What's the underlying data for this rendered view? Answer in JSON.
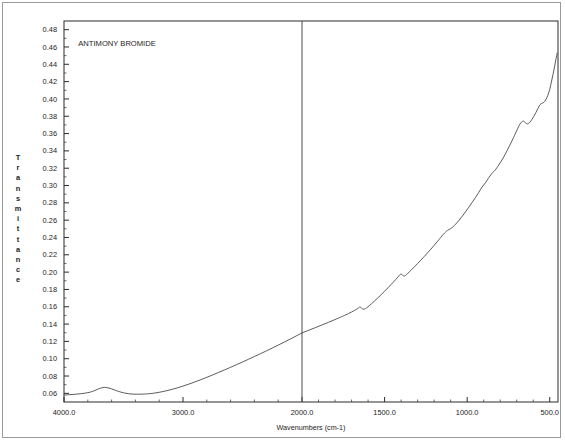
{
  "document": {
    "kind": "ir-spectrum-scan",
    "background_color": "#ffffff",
    "frame_color": "#9a9a9a"
  },
  "chart_data": {
    "type": "line",
    "title": "ANTIMONY BROMIDE",
    "xlabel": "Wavenumbers (cm-1)",
    "ylabel": "Transmittance",
    "ylabel_letters": [
      "T",
      "r",
      "a",
      "n",
      "s",
      "m",
      "i",
      "t",
      "t",
      "a",
      "n",
      "c",
      "e"
    ],
    "grid": false,
    "legend_position": "none",
    "line_color": "#4a4a4a",
    "axis_color": "#2b2b2b",
    "xlim": [
      4000.0,
      450.0
    ],
    "ylim": [
      0.05,
      0.49
    ],
    "x_axis_note": "piecewise scale: 4000-2000 compressed, 2000-450 expanded",
    "x_breakpoint": 2000.0,
    "xticks": [
      4000.0,
      3000.0,
      2000.0,
      1500.0,
      1000.0,
      500.0
    ],
    "xtick_labels": [
      "4000.0",
      "3000.0",
      "2000.0",
      "1500.0",
      "1000.0",
      "500.0"
    ],
    "x_minor_step_high": 200,
    "x_minor_step_low": 100,
    "yticks": [
      0.06,
      0.08,
      0.1,
      0.12,
      0.14,
      0.16,
      0.18,
      0.2,
      0.22,
      0.24,
      0.26,
      0.28,
      0.3,
      0.32,
      0.34,
      0.36,
      0.38,
      0.4,
      0.42,
      0.44,
      0.46,
      0.48
    ],
    "ytick_labels": [
      "0.06",
      "0.08",
      "0.10",
      "0.12",
      "0.14",
      "0.16",
      "0.18",
      "0.20",
      "0.22",
      "0.24",
      "0.26",
      "0.28",
      "0.30",
      "0.32",
      "0.34",
      "0.36",
      "0.38",
      "0.40",
      "0.42",
      "0.44",
      "0.46",
      "0.48"
    ],
    "divider_x": 2000.0,
    "series": [
      {
        "name": "ANTIMONY BROMIDE",
        "x": [
          4000,
          3950,
          3900,
          3850,
          3800,
          3760,
          3720,
          3690,
          3660,
          3630,
          3600,
          3570,
          3540,
          3500,
          3460,
          3420,
          3380,
          3340,
          3300,
          3250,
          3200,
          3150,
          3100,
          3050,
          3000,
          2950,
          2900,
          2850,
          2800,
          2750,
          2700,
          2650,
          2600,
          2550,
          2500,
          2450,
          2400,
          2350,
          2300,
          2250,
          2200,
          2150,
          2100,
          2050,
          2000,
          1960,
          1920,
          1880,
          1840,
          1800,
          1760,
          1740,
          1720,
          1700,
          1680,
          1665,
          1655,
          1648,
          1640,
          1630,
          1615,
          1600,
          1580,
          1560,
          1540,
          1520,
          1500,
          1480,
          1460,
          1440,
          1425,
          1415,
          1408,
          1400,
          1392,
          1384,
          1375,
          1360,
          1340,
          1320,
          1300,
          1280,
          1260,
          1240,
          1220,
          1200,
          1180,
          1160,
          1145,
          1130,
          1120,
          1110,
          1100,
          1085,
          1070,
          1050,
          1030,
          1010,
          990,
          970,
          950,
          930,
          910,
          890,
          875,
          862,
          852,
          845,
          838,
          830,
          820,
          808,
          795,
          782,
          770,
          758,
          745,
          732,
          720,
          706,
          695,
          685,
          676,
          668,
          660,
          650,
          640,
          630,
          620,
          608,
          596,
          584,
          572,
          560,
          548,
          536,
          524,
          512,
          500,
          490,
          480,
          470,
          462,
          455
        ],
        "y": [
          0.058,
          0.0585,
          0.059,
          0.0597,
          0.0608,
          0.0622,
          0.0645,
          0.0661,
          0.0668,
          0.0664,
          0.0652,
          0.0636,
          0.0622,
          0.0606,
          0.0596,
          0.0591,
          0.059,
          0.0591,
          0.0594,
          0.0601,
          0.0612,
          0.0626,
          0.0643,
          0.0662,
          0.0684,
          0.0707,
          0.0732,
          0.0758,
          0.0785,
          0.0813,
          0.0842,
          0.0871,
          0.0901,
          0.0931,
          0.0962,
          0.0993,
          0.1025,
          0.1057,
          0.109,
          0.1123,
          0.1157,
          0.1191,
          0.1226,
          0.1262,
          0.1298,
          0.1328,
          0.1358,
          0.1389,
          0.142,
          0.1452,
          0.1485,
          0.1502,
          0.152,
          0.1539,
          0.156,
          0.1577,
          0.159,
          0.1598,
          0.1584,
          0.1572,
          0.158,
          0.16,
          0.1633,
          0.1668,
          0.1704,
          0.1741,
          0.1779,
          0.1818,
          0.1858,
          0.1899,
          0.1931,
          0.1953,
          0.1968,
          0.1978,
          0.1965,
          0.1956,
          0.196,
          0.1985,
          0.2022,
          0.206,
          0.2099,
          0.2139,
          0.218,
          0.2222,
          0.2265,
          0.2309,
          0.2354,
          0.24,
          0.2435,
          0.2464,
          0.248,
          0.2492,
          0.2501,
          0.2524,
          0.2553,
          0.2597,
          0.2645,
          0.2696,
          0.2749,
          0.2804,
          0.2861,
          0.292,
          0.2981,
          0.303,
          0.3074,
          0.311,
          0.3134,
          0.315,
          0.3164,
          0.318,
          0.3205,
          0.324,
          0.3278,
          0.3318,
          0.336,
          0.3404,
          0.3452,
          0.3502,
          0.3552,
          0.3608,
          0.3654,
          0.3694,
          0.3722,
          0.3736,
          0.3745,
          0.373,
          0.3714,
          0.3716,
          0.3732,
          0.3762,
          0.38,
          0.3842,
          0.3888,
          0.393,
          0.3948,
          0.396,
          0.399,
          0.404,
          0.411,
          0.4195,
          0.4285,
          0.438,
          0.4465,
          0.453
        ]
      }
    ],
    "annotations": [
      {
        "label": "ANTIMONY BROMIDE",
        "x_data": 3880,
        "y_data": 0.461
      }
    ]
  }
}
